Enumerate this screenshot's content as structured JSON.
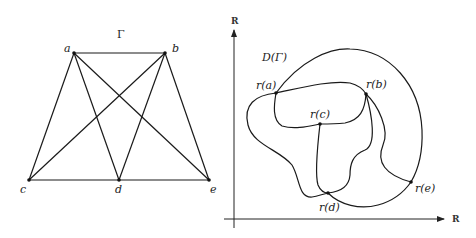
{
  "graph": {
    "title": "Γ",
    "vertices": [
      {
        "id": "a",
        "label": "a"
      },
      {
        "id": "b",
        "label": "b"
      },
      {
        "id": "c",
        "label": "c"
      },
      {
        "id": "d",
        "label": "d"
      },
      {
        "id": "e",
        "label": "e"
      }
    ],
    "edges": [
      [
        "a",
        "b"
      ],
      [
        "a",
        "c"
      ],
      [
        "a",
        "d"
      ],
      [
        "a",
        "e"
      ],
      [
        "b",
        "c"
      ],
      [
        "b",
        "d"
      ],
      [
        "b",
        "e"
      ],
      [
        "c",
        "d"
      ],
      [
        "d",
        "e"
      ]
    ]
  },
  "drawing": {
    "title": "D(Γ)",
    "x_axis_label": "R",
    "y_axis_label": "R",
    "points": [
      {
        "id": "ra",
        "label": "r(a)"
      },
      {
        "id": "rb",
        "label": "r(b)"
      },
      {
        "id": "rc",
        "label": "r(c)"
      },
      {
        "id": "rd",
        "label": "r(d)"
      },
      {
        "id": "re",
        "label": "r(e)"
      }
    ]
  }
}
